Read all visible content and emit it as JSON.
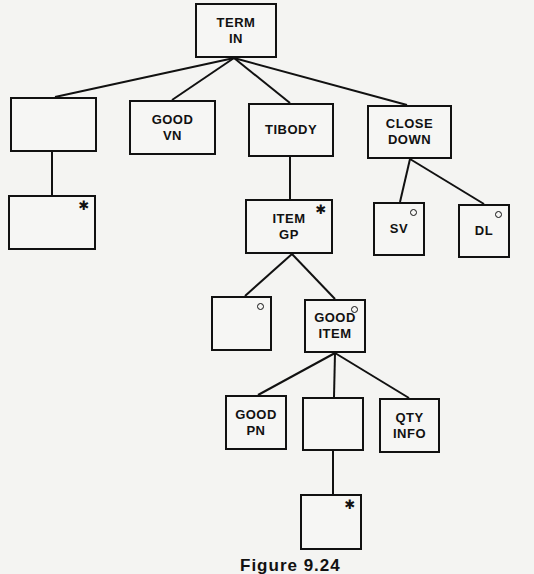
{
  "figure": {
    "caption": "Figure 9.24"
  },
  "nodes": [
    {
      "id": "term-in",
      "label": "TERM\nIN",
      "marker": "",
      "box": [
        195,
        3,
        82,
        55
      ]
    },
    {
      "id": "blank-1",
      "label": "",
      "marker": "",
      "box": [
        10,
        97,
        87,
        55
      ]
    },
    {
      "id": "good-vn",
      "label": "GOOD\nVN",
      "marker": "",
      "box": [
        129,
        100,
        87,
        55
      ]
    },
    {
      "id": "tibody",
      "label": "TIBODY",
      "marker": "",
      "box": [
        248,
        103,
        86,
        54
      ]
    },
    {
      "id": "close-down",
      "label": "CLOSE\nDOWN",
      "marker": "",
      "box": [
        367,
        105,
        85,
        54
      ]
    },
    {
      "id": "blank-iter-1",
      "label": "",
      "marker": "*",
      "box": [
        8,
        195,
        88,
        55
      ]
    },
    {
      "id": "item-gp",
      "label": "ITEM\nGP",
      "marker": "*",
      "box": [
        245,
        199,
        88,
        55
      ]
    },
    {
      "id": "sv",
      "label": "SV",
      "marker": "o",
      "box": [
        373,
        202,
        52,
        54
      ]
    },
    {
      "id": "dl",
      "label": "DL",
      "marker": "o",
      "box": [
        458,
        204,
        52,
        54
      ]
    },
    {
      "id": "blank-sel-1",
      "label": "",
      "marker": "o",
      "box": [
        211,
        296,
        61,
        55
      ]
    },
    {
      "id": "good-item",
      "label": "GOOD\nITEM",
      "marker": "o",
      "box": [
        304,
        299,
        62,
        54
      ]
    },
    {
      "id": "good-pn",
      "label": "GOOD\nPN",
      "marker": "",
      "box": [
        225,
        395,
        62,
        55
      ]
    },
    {
      "id": "blank-2",
      "label": "",
      "marker": "",
      "box": [
        302,
        397,
        62,
        54
      ]
    },
    {
      "id": "qty-info",
      "label": "QTY\nINFO",
      "marker": "",
      "box": [
        379,
        398,
        61,
        55
      ]
    },
    {
      "id": "blank-iter-2",
      "label": "",
      "marker": "*",
      "box": [
        300,
        494,
        62,
        56
      ]
    }
  ],
  "edges": [
    {
      "from": "term-in",
      "to": "blank-1",
      "line": [
        234,
        58,
        55,
        97
      ]
    },
    {
      "from": "term-in",
      "to": "good-vn",
      "line": [
        234,
        58,
        172,
        100
      ]
    },
    {
      "from": "term-in",
      "to": "tibody",
      "line": [
        234,
        58,
        290,
        103
      ]
    },
    {
      "from": "term-in",
      "to": "close-down",
      "line": [
        234,
        58,
        407,
        105
      ]
    },
    {
      "from": "blank-1",
      "to": "blank-iter-1",
      "line": [
        52,
        152,
        52,
        195
      ]
    },
    {
      "from": "tibody",
      "to": "item-gp",
      "line": [
        290,
        157,
        290,
        199
      ]
    },
    {
      "from": "close-down",
      "to": "sv",
      "line": [
        410,
        159,
        400,
        202
      ]
    },
    {
      "from": "close-down",
      "to": "dl",
      "line": [
        410,
        159,
        484,
        204
      ]
    },
    {
      "from": "item-gp",
      "to": "blank-sel-1",
      "line": [
        292,
        254,
        245,
        296
      ]
    },
    {
      "from": "item-gp",
      "to": "good-item",
      "line": [
        292,
        254,
        335,
        299
      ]
    },
    {
      "from": "good-item",
      "to": "good-pn",
      "line": [
        335,
        353,
        258,
        395
      ]
    },
    {
      "from": "good-item",
      "to": "blank-2",
      "line": [
        335,
        353,
        334,
        397
      ]
    },
    {
      "from": "good-item",
      "to": "qty-info",
      "line": [
        335,
        353,
        409,
        398
      ]
    },
    {
      "from": "blank-2",
      "to": "blank-iter-2",
      "line": [
        333,
        451,
        333,
        494
      ]
    }
  ],
  "legend_markers": {
    "*": "iteration",
    "o": "selection"
  },
  "colors": {
    "ink": "#111111",
    "paper": "#f4f4f2"
  }
}
